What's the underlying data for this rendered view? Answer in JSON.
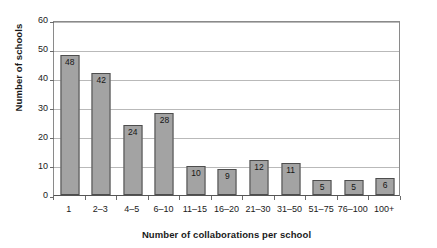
{
  "chart_data": {
    "type": "bar",
    "title": "",
    "subtitle": "",
    "xlabel": "Number of collaborations per school",
    "ylabel": "Number of schools",
    "categories": [
      "1",
      "2–3",
      "4–5",
      "6–10",
      "11–15",
      "16–20",
      "21–30",
      "31–50",
      "51–75",
      "76–100",
      "100+"
    ],
    "values": [
      48,
      42,
      24,
      28,
      10,
      9,
      12,
      11,
      5,
      5,
      6
    ],
    "data_labels": [
      "48",
      "42",
      "24",
      "28",
      "10",
      "9",
      "12",
      "11",
      "5",
      "5",
      "6"
    ],
    "ylim": [
      0,
      60
    ],
    "ytick_values": [
      0,
      10,
      20,
      30,
      40,
      50,
      60
    ],
    "ytick_labels": [
      "0",
      "10",
      "20",
      "30",
      "40",
      "50",
      "60"
    ],
    "grid": true,
    "grid_axis": "y",
    "legend": false,
    "legend_position": "none",
    "bar_fill_color": "#a3a3a3",
    "bar_border_color": "#4d4d4d",
    "gridline_color": "#b9b9b9",
    "axis_color": "#555555",
    "background_color": "#ffffff",
    "text_color": "#1a1a1a"
  }
}
